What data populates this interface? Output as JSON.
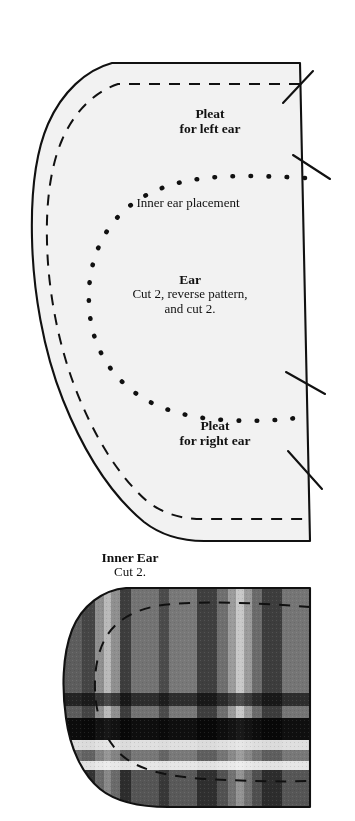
{
  "page": {
    "background_color": "#ffffff",
    "ink_color": "#111111"
  },
  "ear_piece": {
    "name": "Ear",
    "fill_color": "#f2f2f2",
    "outline_color": "#111111",
    "labels": {
      "pleat_left_line1": "Pleat",
      "pleat_left_line2": "for left ear",
      "inner_ear_placement": "Inner ear placement",
      "title": "Ear",
      "instruction_line1": "Cut 2, reverse pattern,",
      "instruction_line2": "and cut 2.",
      "pleat_right_line1": "Pleat",
      "pleat_right_line2": "for right ear"
    },
    "markings": {
      "seam_allowance": "dashed",
      "placement_line": "dotted",
      "pleat_marks": 4
    }
  },
  "inner_ear_piece": {
    "name": "Inner Ear",
    "labels": {
      "title": "Inner Ear",
      "instruction": "Cut 2."
    },
    "fabric": "plaid",
    "markings": {
      "seam_allowance": "dashed"
    },
    "plaid_colors": {
      "base": "#6e6e6e",
      "mid": "#8a8a8a",
      "dark": "#3a3a3a",
      "black": "#0a0a0a",
      "light": "#bdbdbd",
      "white": "#f0f0f0"
    }
  }
}
